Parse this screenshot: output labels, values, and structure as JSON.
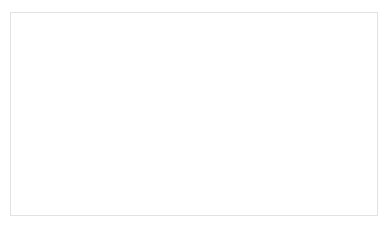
{
  "chart_data": {
    "type": "line",
    "title": "",
    "subtitle": "",
    "xlabel": "",
    "ylabel": "",
    "categories": [
      "2013",
      "2015",
      "2017",
      "2019",
      "2020",
      "2021",
      "2022",
      "2023.3"
    ],
    "values": [
      1870,
      3620,
      6920,
      1980,
      1580,
      1060,
      920,
      130
    ],
    "series": [
      {
        "name": "",
        "values": [
          1870,
          3620,
          6920,
          1980,
          1580,
          1060,
          920,
          130
        ]
      }
    ],
    "ylim": [
      0,
      8000
    ],
    "yticks": [
      0,
      1000,
      2000,
      3000,
      4000,
      5000,
      6000,
      7000,
      8000
    ],
    "ytick_labels": [
      "0",
      "1000",
      "2000",
      "3000",
      "4000",
      "5000",
      "6000",
      "7000",
      "8000"
    ],
    "grid": "horizontal",
    "legend": "none",
    "markers": "filled-circle",
    "line_color": "#3f3f3f",
    "marker_color": "#3f3f3f",
    "gridline_color": "#d9d9d9",
    "axis_color": "#c8c8c8",
    "plot_background": "#ffffff",
    "border_color": "#e2e2e2"
  }
}
